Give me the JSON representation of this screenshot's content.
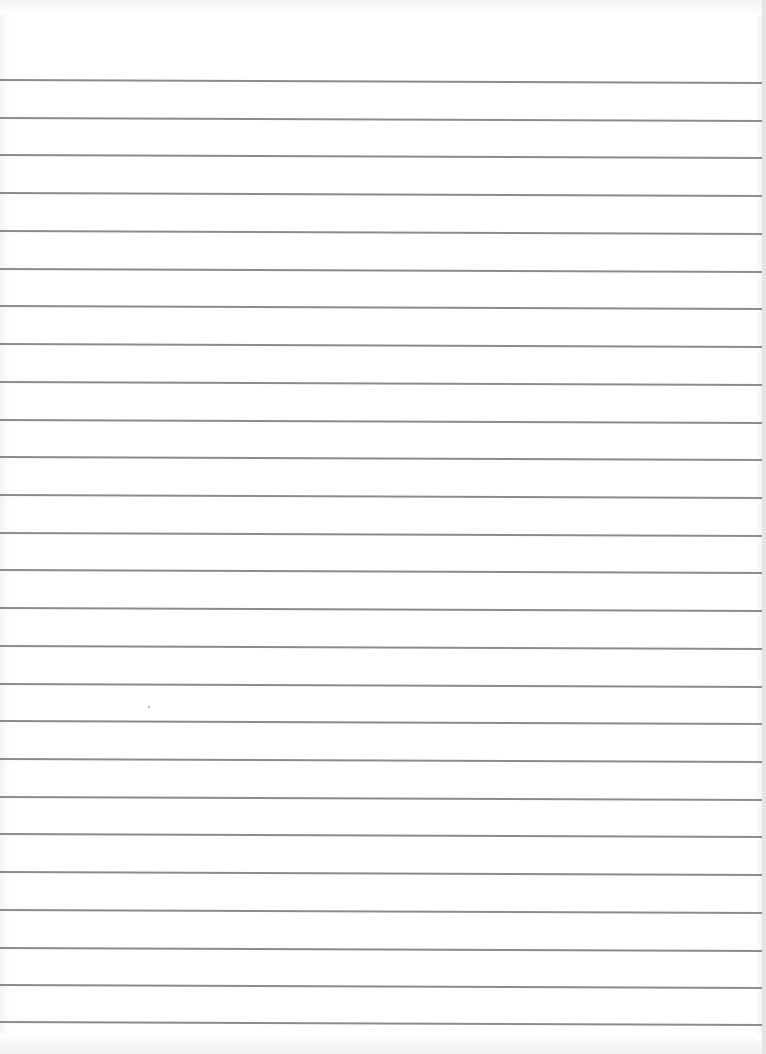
{
  "sheet": {
    "type": "ruled-paper",
    "background_color": "#ffffff",
    "line_color": "#8c8c8c",
    "line_count": 26,
    "first_line_y": 80,
    "line_spacing": 37.7,
    "line_thickness": 2,
    "lines": [
      80,
      118,
      155,
      193,
      231,
      269,
      306,
      344,
      382,
      420,
      457,
      495,
      533,
      570,
      608,
      646,
      684,
      721,
      759,
      797,
      834,
      872,
      910,
      948,
      985,
      1022
    ]
  }
}
